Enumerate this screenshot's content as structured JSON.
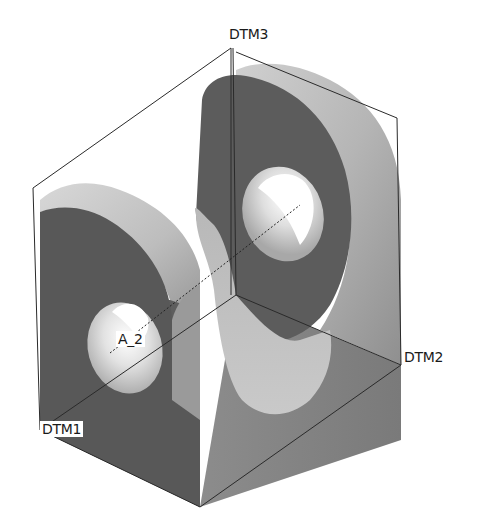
{
  "figure": {
    "labels": {
      "dtm3": "DTM3",
      "dtm2": "DTM2",
      "dtm1": "DTM1",
      "axis": "A_2"
    },
    "colors": {
      "background": "#ffffff",
      "dark_face": "#5a5a5a",
      "mid_face": "#8a8a8a",
      "light_face": "#c8c8c8",
      "highlight": "#e6e6e6",
      "hole": "#f4f4f4",
      "datum_line": "#2a2a2a"
    }
  }
}
